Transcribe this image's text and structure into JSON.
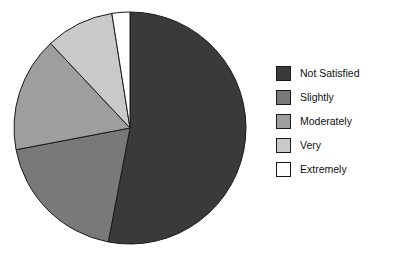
{
  "chart_data": {
    "type": "pie",
    "title": "",
    "subtitle": "",
    "xlabel": "",
    "ylabel": "",
    "legend_position": "right",
    "grid": false,
    "start_angle_deg": 0,
    "direction": "clockwise",
    "categories": [
      "Not Satisfied",
      "Slightly",
      "Moderately",
      "Very",
      "Extremely"
    ],
    "values": [
      53,
      19,
      16,
      9.5,
      2.5
    ],
    "colors": [
      "#3a3a3a",
      "#797979",
      "#9e9e9e",
      "#c9c9c9",
      "#ffffff"
    ],
    "slices": [
      {
        "label": "Not Satisfied",
        "value": 53,
        "percent": "53%",
        "color": "#3a3a3a",
        "start_deg": 0,
        "end_deg": 190.8
      },
      {
        "label": "Slightly",
        "value": 19,
        "percent": "19%",
        "color": "#797979",
        "start_deg": 190.8,
        "end_deg": 259.2
      },
      {
        "label": "Moderately",
        "value": 16,
        "percent": "16%",
        "color": "#9e9e9e",
        "start_deg": 259.2,
        "end_deg": 316.8
      },
      {
        "label": "Very",
        "value": 9.5,
        "percent": "9.5%",
        "color": "#c9c9c9",
        "start_deg": 316.8,
        "end_deg": 351
      },
      {
        "label": "Extremely",
        "value": 2.5,
        "percent": "2.5%",
        "color": "#ffffff",
        "start_deg": 351,
        "end_deg": 360
      }
    ],
    "geometry": {
      "center_x": 130,
      "center_y": 128,
      "radius": 116,
      "stroke": "#1a1a1a",
      "stroke_width": 1
    }
  },
  "legend": {
    "items": [
      {
        "label": "Not Satisfied",
        "color": "#3a3a3a"
      },
      {
        "label": "Slightly",
        "color": "#797979"
      },
      {
        "label": "Moderately",
        "color": "#9e9e9e"
      },
      {
        "label": "Very",
        "color": "#c9c9c9"
      },
      {
        "label": "Extremely",
        "color": "#ffffff"
      }
    ]
  }
}
